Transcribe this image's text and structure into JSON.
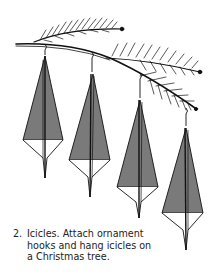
{
  "figure": {
    "icicle_count": 4,
    "colors": {
      "icicle_fill": "#7a7a7a",
      "line": "#111111",
      "background": "#ffffff"
    }
  },
  "caption": {
    "number": "2.",
    "lines": [
      "Icicles. Attach ornament",
      "hooks and hang icicles on",
      "a Christmas tree."
    ]
  }
}
